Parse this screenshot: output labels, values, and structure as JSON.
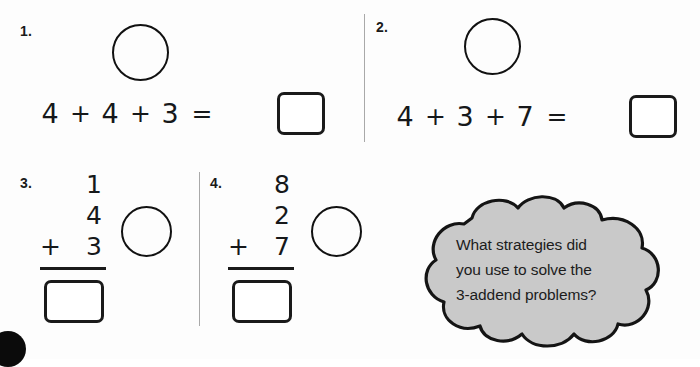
{
  "worksheet": {
    "problems": [
      {
        "number": "1.",
        "layout": "horizontal",
        "addends": [
          "4",
          "4",
          "3"
        ],
        "operators": [
          "+",
          "+"
        ],
        "equals": "=",
        "answer": "",
        "has_circle": true
      },
      {
        "number": "2.",
        "layout": "horizontal",
        "addends": [
          "4",
          "3",
          "7"
        ],
        "operators": [
          "+",
          "+"
        ],
        "equals": "=",
        "answer": "",
        "has_circle": true
      },
      {
        "number": "3.",
        "layout": "vertical",
        "addends": [
          "1",
          "4",
          "3"
        ],
        "operator": "+",
        "answer": "",
        "has_circle": true
      },
      {
        "number": "4.",
        "layout": "vertical",
        "addends": [
          "8",
          "2",
          "7"
        ],
        "operator": "+",
        "answer": "",
        "has_circle": true
      }
    ],
    "thought_cloud": {
      "line1": "What strategies did",
      "line2": "you use to solve the",
      "line3": "3-addend problems?",
      "fill_color": "#c9c9c9",
      "stroke_color": "#141414"
    },
    "colors": {
      "ink": "#16181a",
      "rule": "#1a1a1a",
      "divider": "#a9a9a9",
      "page": "#fdfdfd"
    }
  }
}
